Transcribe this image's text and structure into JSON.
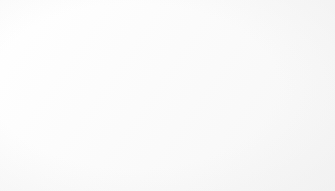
{
  "chart_data": {
    "type": "pie",
    "title": "",
    "subtitle": "",
    "xlabel": "",
    "ylabel": "",
    "legend_position": "right",
    "exploded": true,
    "start_angle_deg": 0,
    "direction": "clockwise",
    "categories": [
      "Galvanizing",
      "Zinc-based alloys",
      "Brass and bronze",
      "Other uses"
    ],
    "values": [
      55,
      21,
      16,
      8
    ],
    "unit": "%",
    "data_labels": [
      "55%",
      "21%",
      "16%",
      "8%"
    ],
    "colors": [
      "#3c3c3c",
      "#1b1b1b",
      "#8a8a8a",
      "#1b1b1b"
    ],
    "label_color": "#ffffff",
    "background": "#fcfcfc",
    "slices": [
      {
        "label": "Galvanizing",
        "value": 55,
        "data_label": "55%",
        "color": "#3c3c3c"
      },
      {
        "label": "Zinc-based alloys",
        "value": 21,
        "data_label": "21%",
        "color": "#1b1b1b"
      },
      {
        "label": "Brass and bronze",
        "value": 16,
        "data_label": "16%",
        "color": "#8a8a8a"
      },
      {
        "label": "Other uses",
        "value": 8,
        "data_label": "8%",
        "color": "#1b1b1b"
      }
    ]
  },
  "legend": {
    "items": [
      {
        "label": "Galvanizing",
        "color": "#3c3c3c"
      },
      {
        "label": "Zinc-based alloys",
        "color": "#1b1b1b"
      },
      {
        "label": "Brass and bronze",
        "color": "#8a8a8a"
      },
      {
        "label": "Other uses",
        "color": "#1b1b1b"
      }
    ]
  }
}
